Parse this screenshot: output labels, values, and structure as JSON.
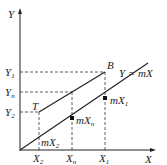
{
  "diagram": {
    "axes": {
      "x_label": "X",
      "y_label": "Y"
    },
    "points": {
      "B": "B",
      "T": "T"
    },
    "line_label": "Y = mX",
    "x_ticks": [
      {
        "main": "X",
        "sub": "2"
      },
      {
        "main": "X",
        "sub": "n"
      },
      {
        "main": "X",
        "sub": "1"
      }
    ],
    "y_ticks": [
      {
        "main": "Y",
        "sub": "1"
      },
      {
        "main": "Y",
        "sub": "n"
      },
      {
        "main": "Y",
        "sub": "2"
      }
    ],
    "annotations": [
      {
        "main": "mX",
        "sub": "1"
      },
      {
        "main": "mX",
        "sub": "n"
      },
      {
        "main": "mX",
        "sub": "2"
      }
    ],
    "colors": {
      "stroke": "#222222",
      "background": "#ffffff"
    }
  }
}
